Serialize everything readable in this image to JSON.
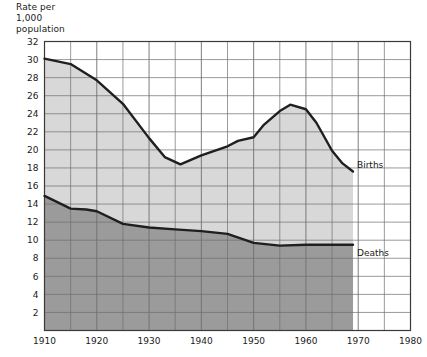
{
  "chart_data": {
    "type": "area",
    "title": "Rate per\n1,000\npopulation",
    "title_lines": [
      "Rate per",
      "1,000",
      "population"
    ],
    "xlabel": "",
    "ylabel": "Rate per 1,000 population",
    "xlim": [
      1910,
      1980
    ],
    "ylim": [
      0,
      32
    ],
    "grid": true,
    "x_major_step": 10,
    "x_minor_step": 5,
    "y_tick_step": 2,
    "legend_position": "inline-right",
    "x_tick_labels": [
      "1910",
      "1920",
      "1930",
      "1940",
      "1950",
      "1960",
      "1970",
      "1980"
    ],
    "x_tick_values": [
      1910,
      1920,
      1930,
      1940,
      1950,
      1960,
      1970,
      1980
    ],
    "y_tick_labels": [
      "2",
      "4",
      "6",
      "8",
      "10",
      "12",
      "14",
      "16",
      "18",
      "20",
      "22",
      "24",
      "26",
      "28",
      "30",
      "32"
    ],
    "y_tick_values": [
      2,
      4,
      6,
      8,
      10,
      12,
      14,
      16,
      18,
      20,
      22,
      24,
      26,
      28,
      30,
      32
    ],
    "colors": {
      "births_band": "#d8d8d8",
      "deaths_band": "#9b9b9b",
      "line": "#1f1f1f",
      "grid": "#6f6f6f",
      "frame": "#3a3a3a",
      "background": "#ffffff"
    },
    "series": [
      {
        "name": "Births",
        "label": "Births",
        "x": [
          1910,
          1915,
          1920,
          1925,
          1930,
          1933,
          1936,
          1940,
          1945,
          1947,
          1950,
          1952,
          1955,
          1957,
          1960,
          1962,
          1965,
          1967,
          1969
        ],
        "values": [
          30.1,
          29.5,
          27.7,
          25.1,
          21.3,
          19.2,
          18.4,
          19.4,
          20.4,
          21.0,
          21.4,
          22.8,
          24.3,
          25.0,
          24.5,
          23.0,
          19.9,
          18.5,
          17.6
        ]
      },
      {
        "name": "Deaths",
        "label": "Deaths",
        "x": [
          1910,
          1915,
          1918,
          1920,
          1925,
          1930,
          1935,
          1940,
          1945,
          1950,
          1955,
          1960,
          1965,
          1969
        ],
        "values": [
          14.9,
          13.5,
          13.4,
          13.2,
          11.8,
          11.4,
          11.2,
          11.0,
          10.7,
          9.7,
          9.4,
          9.5,
          9.5,
          9.5
        ]
      }
    ],
    "data_end_year": 1969
  }
}
